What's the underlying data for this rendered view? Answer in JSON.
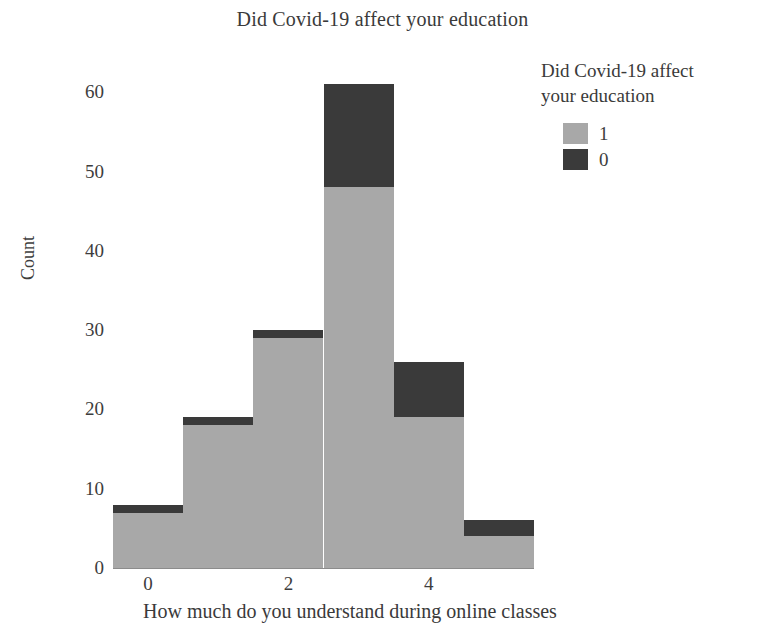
{
  "chart_data": {
    "type": "bar",
    "subtype": "stacked-histogram",
    "title": "Did Covid-19 affect your education",
    "xlabel": "How much do you understand during online classes",
    "ylabel": "Count",
    "x": [
      0,
      1,
      2,
      3,
      4,
      5
    ],
    "categories": [
      "0",
      "1",
      "2",
      "3",
      "4",
      "5"
    ],
    "series": [
      {
        "name": "1",
        "color": "#a8a8a8",
        "values": [
          7,
          18,
          29,
          48,
          19,
          4
        ]
      },
      {
        "name": "0",
        "color": "#3a3a3a",
        "values": [
          1,
          1,
          1,
          13,
          7,
          2
        ]
      }
    ],
    "totals": [
      8,
      19,
      30,
      61,
      26,
      6
    ],
    "xlim": [
      -0.5,
      5.5
    ],
    "ylim": [
      0,
      61
    ],
    "xticks": [
      0,
      2,
      4
    ],
    "xtick_labels": [
      "0",
      "2",
      "4"
    ],
    "yticks": [
      0,
      10,
      20,
      30,
      40,
      50,
      60
    ],
    "ytick_labels": [
      "0",
      "10",
      "20",
      "30",
      "40",
      "50",
      "60"
    ],
    "grid": false,
    "legend": {
      "title": "Did Covid-19 affect your education",
      "title_line_1": "Did Covid-19 affect",
      "title_line_2": "your education",
      "position": "right-top",
      "entries": [
        {
          "label": "1",
          "color": "#a8a8a8"
        },
        {
          "label": "0",
          "color": "#3a3a3a"
        }
      ]
    },
    "bar_width": 1.0,
    "stack_order": [
      "1",
      "0"
    ]
  },
  "axes": {
    "y_min": 0,
    "y_max": 61.8,
    "x_min": -0.5,
    "x_max": 5.5
  },
  "colors": {
    "series_1": "#a8a8a8",
    "series_0": "#3a3a3a",
    "axis": "#8c8c8c",
    "text": "#3a3a3a",
    "background": "#ffffff"
  }
}
